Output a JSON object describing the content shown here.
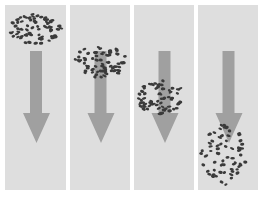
{
  "figure": {
    "background_color": "#ffffff",
    "panel_color": "#dedede",
    "arrow_color": "#a0a0a0",
    "particle_color": "#3a3a3a",
    "panels": [
      {
        "id": 1,
        "x": 5,
        "width": 61,
        "cloud": {
          "cx": 30,
          "cy": 24,
          "rx": 26,
          "ry": 15,
          "count": 70,
          "seed": 11
        }
      },
      {
        "id": 2,
        "x": 70,
        "width": 60,
        "cloud": {
          "cx": 30,
          "cy": 57,
          "rx": 27,
          "ry": 16,
          "count": 70,
          "seed": 23
        }
      },
      {
        "id": 3,
        "x": 134,
        "width": 60,
        "cloud": {
          "cx": 26,
          "cy": 92,
          "rx": 24,
          "ry": 17,
          "count": 65,
          "seed": 37
        }
      },
      {
        "id": 4,
        "x": 198,
        "width": 60,
        "cloud": {
          "cx": 26,
          "cy": 150,
          "rx": 23,
          "ry": 30,
          "count": 65,
          "seed": 51
        }
      }
    ],
    "arrow": {
      "shaft_x": 25,
      "shaft_w": 12,
      "shaft_top": 46,
      "shaft_bottom": 108,
      "head_left": 18,
      "head_right": 45,
      "head_bottom": 138
    }
  }
}
